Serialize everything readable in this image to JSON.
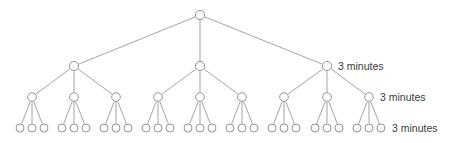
{
  "diagram": {
    "background_color": "#ffffff",
    "line_color": "#9a9a9a",
    "node_stroke_color": "#8d8d8d",
    "node_fill_color": "#ffffff",
    "text_color": "#3a3a3a",
    "branching_factor": 3,
    "levels": 4
  },
  "labels": {
    "level2": "3 minutes",
    "level3": "3 minutes",
    "level4": "3 minutes"
  },
  "nodes": {
    "root": {
      "id": "root",
      "x": 200,
      "y": 15,
      "r": 4.6
    },
    "level2": [
      {
        "id": "n2-1",
        "x": 74,
        "y": 66,
        "r": 4.6
      },
      {
        "id": "n2-2",
        "x": 200,
        "y": 66,
        "r": 4.6
      },
      {
        "id": "n2-3",
        "x": 327,
        "y": 66,
        "r": 4.6
      }
    ],
    "level3": [
      {
        "id": "n3-1",
        "x": 32,
        "y": 97,
        "r": 4.3
      },
      {
        "id": "n3-2",
        "x": 74,
        "y": 97,
        "r": 4.3
      },
      {
        "id": "n3-3",
        "x": 116,
        "y": 97,
        "r": 4.3
      },
      {
        "id": "n3-4",
        "x": 158,
        "y": 97,
        "r": 4.3
      },
      {
        "id": "n3-5",
        "x": 200,
        "y": 97,
        "r": 4.3
      },
      {
        "id": "n3-6",
        "x": 242,
        "y": 97,
        "r": 4.3
      },
      {
        "id": "n3-7",
        "x": 284,
        "y": 97,
        "r": 4.3
      },
      {
        "id": "n3-8",
        "x": 327,
        "y": 97,
        "r": 4.3
      },
      {
        "id": "n3-9",
        "x": 369,
        "y": 97,
        "r": 4.3
      }
    ],
    "level4": [
      {
        "id": "n4-1",
        "x": 20,
        "y": 128,
        "r": 4.0
      },
      {
        "id": "n4-2",
        "x": 32,
        "y": 128,
        "r": 4.0
      },
      {
        "id": "n4-3",
        "x": 44,
        "y": 128,
        "r": 4.0
      },
      {
        "id": "n4-4",
        "x": 62,
        "y": 128,
        "r": 4.0
      },
      {
        "id": "n4-5",
        "x": 74,
        "y": 128,
        "r": 4.0
      },
      {
        "id": "n4-6",
        "x": 86,
        "y": 128,
        "r": 4.0
      },
      {
        "id": "n4-7",
        "x": 104,
        "y": 128,
        "r": 4.0
      },
      {
        "id": "n4-8",
        "x": 116,
        "y": 128,
        "r": 4.0
      },
      {
        "id": "n4-9",
        "x": 128,
        "y": 128,
        "r": 4.0
      },
      {
        "id": "n4-10",
        "x": 146,
        "y": 128,
        "r": 4.0
      },
      {
        "id": "n4-11",
        "x": 158,
        "y": 128,
        "r": 4.0
      },
      {
        "id": "n4-12",
        "x": 170,
        "y": 128,
        "r": 4.0
      },
      {
        "id": "n4-13",
        "x": 188,
        "y": 128,
        "r": 4.0
      },
      {
        "id": "n4-14",
        "x": 200,
        "y": 128,
        "r": 4.0
      },
      {
        "id": "n4-15",
        "x": 212,
        "y": 128,
        "r": 4.0
      },
      {
        "id": "n4-16",
        "x": 230,
        "y": 128,
        "r": 4.0
      },
      {
        "id": "n4-17",
        "x": 242,
        "y": 128,
        "r": 4.0
      },
      {
        "id": "n4-18",
        "x": 254,
        "y": 128,
        "r": 4.0
      },
      {
        "id": "n4-19",
        "x": 272,
        "y": 128,
        "r": 4.0
      },
      {
        "id": "n4-20",
        "x": 284,
        "y": 128,
        "r": 4.0
      },
      {
        "id": "n4-21",
        "x": 296,
        "y": 128,
        "r": 4.0
      },
      {
        "id": "n4-22",
        "x": 315,
        "y": 128,
        "r": 4.0
      },
      {
        "id": "n4-23",
        "x": 327,
        "y": 128,
        "r": 4.0
      },
      {
        "id": "n4-24",
        "x": 339,
        "y": 128,
        "r": 4.0
      },
      {
        "id": "n4-25",
        "x": 357,
        "y": 128,
        "r": 4.0
      },
      {
        "id": "n4-26",
        "x": 369,
        "y": 128,
        "r": 4.0
      },
      {
        "id": "n4-27",
        "x": 381,
        "y": 128,
        "r": 4.0
      }
    ]
  },
  "edges": [
    {
      "from": "root",
      "to": "n2-1"
    },
    {
      "from": "root",
      "to": "n2-2"
    },
    {
      "from": "root",
      "to": "n2-3"
    },
    {
      "from": "n2-1",
      "to": "n3-1"
    },
    {
      "from": "n2-1",
      "to": "n3-2"
    },
    {
      "from": "n2-1",
      "to": "n3-3"
    },
    {
      "from": "n2-2",
      "to": "n3-4"
    },
    {
      "from": "n2-2",
      "to": "n3-5"
    },
    {
      "from": "n2-2",
      "to": "n3-6"
    },
    {
      "from": "n2-3",
      "to": "n3-7"
    },
    {
      "from": "n2-3",
      "to": "n3-8"
    },
    {
      "from": "n2-3",
      "to": "n3-9"
    },
    {
      "from": "n3-1",
      "to": "n4-1"
    },
    {
      "from": "n3-1",
      "to": "n4-2"
    },
    {
      "from": "n3-1",
      "to": "n4-3"
    },
    {
      "from": "n3-2",
      "to": "n4-4"
    },
    {
      "from": "n3-2",
      "to": "n4-5"
    },
    {
      "from": "n3-2",
      "to": "n4-6"
    },
    {
      "from": "n3-3",
      "to": "n4-7"
    },
    {
      "from": "n3-3",
      "to": "n4-8"
    },
    {
      "from": "n3-3",
      "to": "n4-9"
    },
    {
      "from": "n3-4",
      "to": "n4-10"
    },
    {
      "from": "n3-4",
      "to": "n4-11"
    },
    {
      "from": "n3-4",
      "to": "n4-12"
    },
    {
      "from": "n3-5",
      "to": "n4-13"
    },
    {
      "from": "n3-5",
      "to": "n4-14"
    },
    {
      "from": "n3-5",
      "to": "n4-15"
    },
    {
      "from": "n3-6",
      "to": "n4-16"
    },
    {
      "from": "n3-6",
      "to": "n4-17"
    },
    {
      "from": "n3-6",
      "to": "n4-18"
    },
    {
      "from": "n3-7",
      "to": "n4-19"
    },
    {
      "from": "n3-7",
      "to": "n4-20"
    },
    {
      "from": "n3-7",
      "to": "n4-21"
    },
    {
      "from": "n3-8",
      "to": "n4-22"
    },
    {
      "from": "n3-8",
      "to": "n4-23"
    },
    {
      "from": "n3-8",
      "to": "n4-24"
    },
    {
      "from": "n3-9",
      "to": "n4-25"
    },
    {
      "from": "n3-9",
      "to": "n4-26"
    },
    {
      "from": "n3-9",
      "to": "n4-27"
    }
  ],
  "label_positions": {
    "level2": {
      "x": 338,
      "y": 61
    },
    "level3": {
      "x": 380,
      "y": 92
    },
    "level4": {
      "x": 392,
      "y": 123
    }
  }
}
